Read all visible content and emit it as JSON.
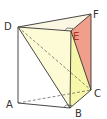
{
  "diagram": {
    "type": "triangular-prism",
    "vertices": {
      "D": {
        "label": "D",
        "x": 18,
        "y": 27
      },
      "E": {
        "label": "E",
        "x": 71,
        "y": 31
      },
      "F": {
        "label": "F",
        "x": 91,
        "y": 14
      },
      "A": {
        "label": "A",
        "x": 18,
        "y": 103
      },
      "B": {
        "label": "B",
        "x": 70,
        "y": 108
      },
      "C": {
        "label": "C",
        "x": 91,
        "y": 90
      }
    },
    "colors": {
      "top_face": "#fbf6e4",
      "plane_DEB": "#fdfbd6",
      "face_EFC": "#f0a08a",
      "region_EBC": "#f6f7a8",
      "edge": "#333333",
      "label_E": "#b03020"
    }
  }
}
